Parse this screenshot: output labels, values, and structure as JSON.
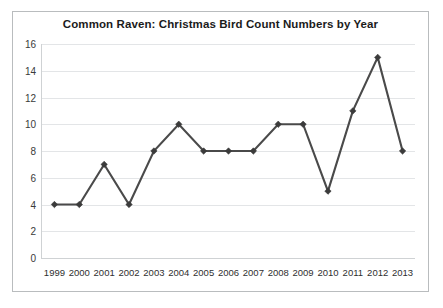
{
  "chart_data": {
    "type": "line",
    "title": "Common Raven: Christmas Bird Count Numbers by Year",
    "xlabel": "",
    "ylabel": "",
    "categories": [
      "1999",
      "2000",
      "2001",
      "2002",
      "2003",
      "2004",
      "2005",
      "2006",
      "2007",
      "2008",
      "2009",
      "2010",
      "2011",
      "2012",
      "2013"
    ],
    "values": [
      4,
      4,
      7,
      4,
      8,
      10,
      8,
      8,
      8,
      10,
      10,
      5,
      11,
      15,
      8
    ],
    "series": [
      {
        "name": "Common Raven count",
        "values": [
          4,
          4,
          7,
          4,
          8,
          10,
          8,
          8,
          8,
          10,
          10,
          5,
          11,
          15,
          8
        ]
      }
    ],
    "ylim": [
      0,
      16
    ],
    "ytick_values": [
      0,
      2,
      4,
      6,
      8,
      10,
      12,
      14,
      16
    ],
    "ytick_labels": [
      "0",
      "2",
      "4",
      "6",
      "8",
      "10",
      "12",
      "14",
      "16"
    ],
    "xtick_labels": [
      "1999",
      "2000",
      "2001",
      "2002",
      "2003",
      "2004",
      "2005",
      "2006",
      "2007",
      "2008",
      "2009",
      "2010",
      "2011",
      "2012",
      "2013"
    ],
    "grid": true,
    "legend": false,
    "legend_position": "none",
    "line_color": "#4a4a4a",
    "marker_color": "#3b3b3b",
    "gridline_color": "#e3e5e7",
    "axis_color": "#cfd2d4",
    "border_color": "#b9bcbe",
    "background_color": "#ffffff",
    "title_color": "#1b1b1b"
  }
}
